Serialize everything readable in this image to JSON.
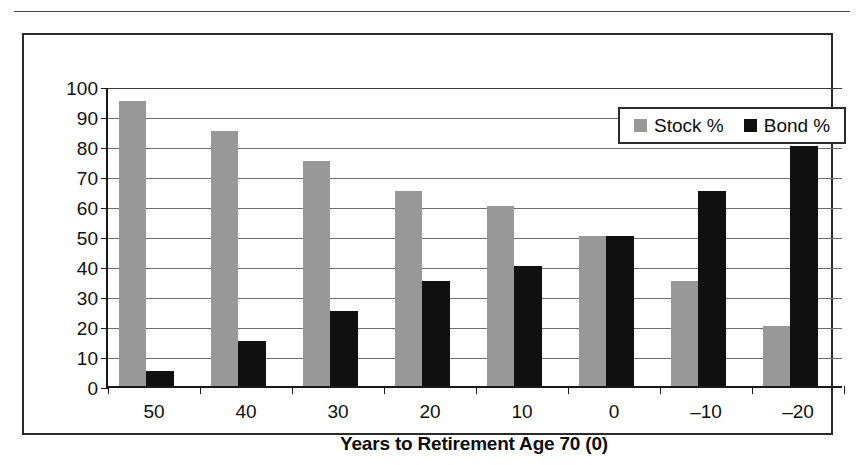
{
  "figure": {
    "has_top_rule": true,
    "frame_border_color": "#2b2b2b",
    "background": "#ffffff"
  },
  "chart_data": {
    "type": "bar",
    "title": "",
    "xlabel": "Years to Retirement Age 70 (0)",
    "ylabel": "",
    "categories": [
      "50",
      "40",
      "30",
      "20",
      "10",
      "0",
      "–10",
      "–20"
    ],
    "series": [
      {
        "name": "Stock %",
        "color": "#989898",
        "values": [
          95,
          85,
          75,
          65,
          60,
          50,
          35,
          20
        ]
      },
      {
        "name": "Bond %",
        "color": "#101010",
        "values": [
          5,
          15,
          25,
          35,
          40,
          50,
          65,
          80
        ]
      }
    ],
    "ylim": [
      0,
      100
    ],
    "ytick_step": 10,
    "yticks": [
      0,
      10,
      20,
      30,
      40,
      50,
      60,
      70,
      80,
      90,
      100
    ],
    "ytick_labels": [
      "0",
      "10",
      "20",
      "30",
      "40",
      "50",
      "60",
      "70",
      "80",
      "90",
      "100"
    ],
    "grid": true,
    "grid_axis": "y",
    "legend_position": "top-right",
    "legend_entries": [
      "Stock %",
      "Bond %"
    ]
  }
}
